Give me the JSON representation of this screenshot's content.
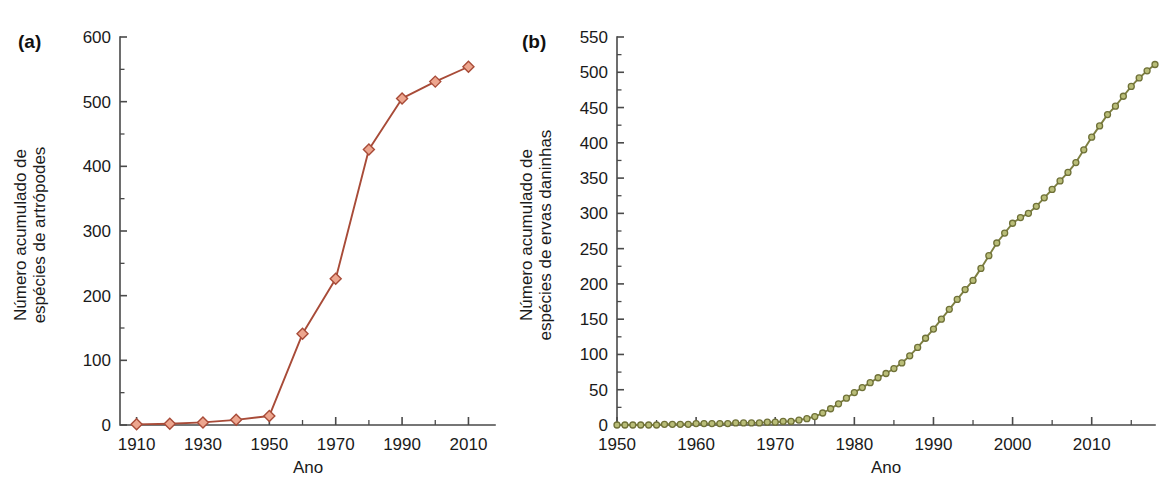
{
  "figure": {
    "background": "#ffffff",
    "panels": [
      {
        "tag": "(a)",
        "name": "panel-a"
      },
      {
        "tag": "(b)",
        "name": "panel-b"
      }
    ]
  },
  "chart_data": [
    {
      "type": "line",
      "panel": "(a)",
      "title": "",
      "xlabel": "Ano",
      "ylabel": "Número acumulado de espécies de artrópodes",
      "ylabel_line1": "Número acumulado de",
      "ylabel_line2": "espécies de artrópodes",
      "xlim": [
        1905,
        2018
      ],
      "ylim": [
        0,
        600
      ],
      "xticks": [
        1910,
        1930,
        1950,
        1970,
        1990,
        2010
      ],
      "xtick_labels": [
        "1910",
        "1930",
        "1950",
        "1970",
        "1990",
        "2010"
      ],
      "xminor_step": 10,
      "yticks": [
        0,
        100,
        200,
        300,
        400,
        500,
        600
      ],
      "ytick_labels": [
        "0",
        "100",
        "200",
        "300",
        "400",
        "500",
        "600"
      ],
      "grid": false,
      "legend": "none",
      "marker": "diamond",
      "marker_size": 11,
      "line_color": "#a84b38",
      "marker_fill": "#eda68f",
      "marker_edge": "#a84b38",
      "x": [
        1910,
        1920,
        1930,
        1940,
        1950,
        1960,
        1970,
        1980,
        1990,
        2000,
        2010
      ],
      "values": [
        1,
        2,
        4,
        8,
        14,
        141,
        226,
        426,
        505,
        531,
        554
      ]
    },
    {
      "type": "line",
      "panel": "(b)",
      "title": "",
      "xlabel": "Ano",
      "ylabel": "Número acumulado de espécies de ervas daninhas",
      "ylabel_line1": "Número acumulado de",
      "ylabel_line2": "espécies de ervas daninhas",
      "xlim": [
        1950,
        2018
      ],
      "ylim": [
        0,
        550
      ],
      "xticks": [
        1950,
        1960,
        1970,
        1980,
        1990,
        2000,
        2010
      ],
      "xtick_labels": [
        "1950",
        "1960",
        "1970",
        "1980",
        "1990",
        "2000",
        "2010"
      ],
      "xminor_step": 5,
      "yticks": [
        0,
        50,
        100,
        150,
        200,
        250,
        300,
        350,
        400,
        450,
        500,
        550
      ],
      "ytick_labels": [
        "0",
        "50",
        "100",
        "150",
        "200",
        "250",
        "300",
        "350",
        "400",
        "450",
        "500",
        "550"
      ],
      "grid": false,
      "legend": "none",
      "marker": "circle",
      "marker_size": 6,
      "line_color": "#7d7f41",
      "marker_fill": "#b9bd78",
      "marker_edge": "#6f7138",
      "x": [
        1950,
        1951,
        1952,
        1953,
        1954,
        1955,
        1956,
        1957,
        1958,
        1959,
        1960,
        1961,
        1962,
        1963,
        1964,
        1965,
        1966,
        1967,
        1968,
        1969,
        1970,
        1971,
        1972,
        1973,
        1974,
        1975,
        1976,
        1977,
        1978,
        1979,
        1980,
        1981,
        1982,
        1983,
        1984,
        1985,
        1986,
        1987,
        1988,
        1989,
        1990,
        1991,
        1992,
        1993,
        1994,
        1995,
        1996,
        1997,
        1998,
        1999,
        2000,
        2001,
        2002,
        2003,
        2004,
        2005,
        2006,
        2007,
        2008,
        2009,
        2010,
        2011,
        2012,
        2013,
        2014,
        2015,
        2016,
        2017,
        2018
      ],
      "values": [
        0,
        0,
        0,
        0,
        0,
        0,
        1,
        1,
        1,
        1,
        2,
        2,
        2,
        2,
        2,
        3,
        3,
        3,
        3,
        4,
        4,
        5,
        5,
        7,
        9,
        12,
        17,
        23,
        30,
        38,
        46,
        53,
        60,
        67,
        73,
        80,
        88,
        98,
        110,
        123,
        136,
        150,
        164,
        178,
        192,
        205,
        222,
        240,
        258,
        272,
        286,
        294,
        300,
        310,
        322,
        334,
        346,
        358,
        372,
        390,
        408,
        424,
        440,
        452,
        466,
        480,
        492,
        502,
        511
      ]
    }
  ]
}
